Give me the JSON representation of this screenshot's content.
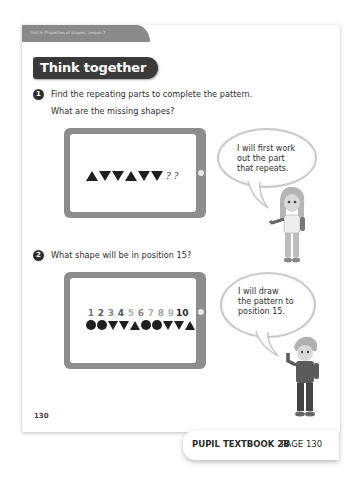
{
  "page": {
    "unit_header": "Unit 9: Properties of shapes, Lesson 7",
    "section_title": "Think together",
    "page_number": "130"
  },
  "questions": [
    {
      "number": "1",
      "lines": [
        "Find the repeating parts to complete the pattern.",
        "What are the missing shapes?"
      ],
      "pattern": [
        "triangle-up",
        "triangle-down",
        "triangle-down",
        "triangle-up",
        "triangle-down",
        "triangle-down",
        "?",
        "?"
      ],
      "speech": [
        "I will first work",
        "out the part",
        "that repeats."
      ]
    },
    {
      "number": "2",
      "lines": [
        "What shape will be in position 15?"
      ],
      "positions": [
        "1",
        "2",
        "3",
        "4",
        "5",
        "6",
        "7",
        "8",
        "9",
        "10"
      ],
      "position_colors": [
        "#7a7a7a",
        "#5a5a5a",
        "#8a8a8a",
        "#555555",
        "#b0b0b0",
        "#8a8a8a",
        "#b0b0b0",
        "#a0a0a0",
        "#b5b5b5",
        "#2a2a2a"
      ],
      "pattern": [
        "circle",
        "circle",
        "triangle-down",
        "triangle-down",
        "triangle-up",
        "circle",
        "circle",
        "triangle-down",
        "triangle-down",
        "triangle-up"
      ],
      "speech": [
        "I will draw",
        "the pattern to",
        "position 15."
      ]
    }
  ],
  "footer": {
    "book": "PUPIL TEXTBOOK 2B",
    "page": "PAGE 130"
  }
}
